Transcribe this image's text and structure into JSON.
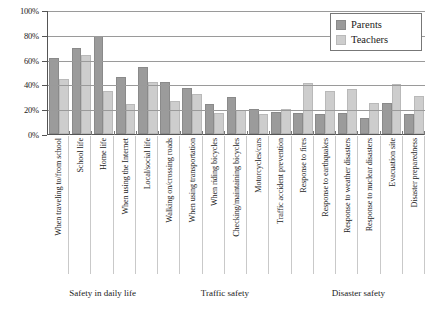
{
  "chart_data": {
    "type": "bar",
    "title": "",
    "xlabel": "",
    "ylabel": "",
    "ylim": [
      0,
      100
    ],
    "y_ticks": [
      "0%",
      "20%",
      "40%",
      "60%",
      "80%",
      "100%"
    ],
    "y_tick_values": [
      0,
      20,
      40,
      60,
      80,
      100
    ],
    "grid": true,
    "legend_position": "top-right",
    "categories": [
      "When traveling to/from school",
      "School life",
      "Home life",
      "When using the Internet",
      "Local/social life",
      "Walking on/crossing roads",
      "When using transportation",
      "When riding bicycles",
      "Checking/maintaining bicycles",
      "Motorcycles/cars",
      "Traffic accident prevention",
      "Response to fires",
      "Response to earthquakes",
      "Response to weather disasters",
      "Response to nuclear disasters",
      "Evacuation site",
      "Disaster preparedness"
    ],
    "series": [
      {
        "name": "Parents",
        "color": "#9b9b9b",
        "values": [
          61,
          69,
          79,
          46,
          54,
          42,
          37,
          24,
          30,
          20,
          18,
          17,
          16,
          17,
          13,
          25,
          16
        ]
      },
      {
        "name": "Teachers",
        "color": "#cdcdcd",
        "values": [
          44,
          64,
          35,
          24,
          42,
          27,
          32,
          17,
          19,
          16,
          20,
          41,
          35,
          36,
          25,
          40,
          31
        ]
      }
    ],
    "groups": [
      {
        "label": "Safety in daily life",
        "start": 0,
        "end": 4
      },
      {
        "label": "Traffic safety",
        "start": 5,
        "end": 10
      },
      {
        "label": "Disaster safety",
        "start": 11,
        "end": 16
      }
    ]
  }
}
